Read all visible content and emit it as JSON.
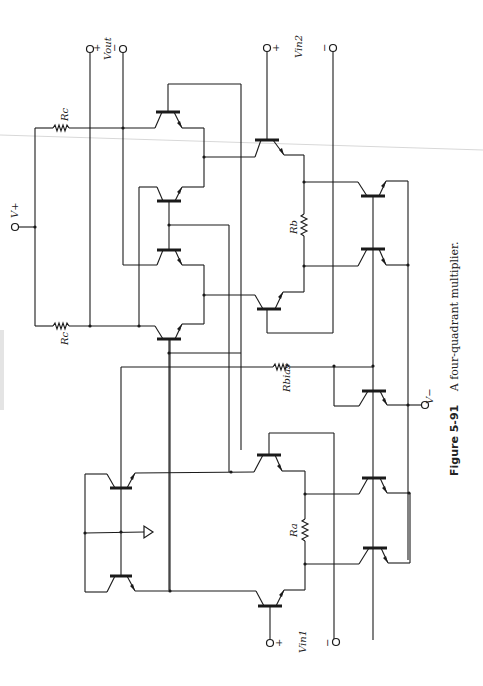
{
  "figure": {
    "number": "Figure 5-91",
    "caption": "A four-quadrant multiplier.",
    "orientation": "rotated 90° counter-clockwise (landscape page)"
  },
  "labels": {
    "v_plus": "V+",
    "v_minus": "V−",
    "v_out": "Vout",
    "v_in1": "Vin1",
    "v_in2": "Vin2",
    "rc_top": "Rc",
    "rc_bottom": "Rc",
    "rb": "Rb",
    "ra": "Ra",
    "rbias": "Rbias",
    "plus": "+",
    "minus": "−"
  },
  "components": {
    "resistors": [
      "Rc (top)",
      "Rc (bottom)",
      "Rb",
      "Ra",
      "Rbias"
    ],
    "transistor_count": 14,
    "terminals": [
      "V+",
      "V−",
      "Vout +",
      "Vout −",
      "Vin1 +",
      "Vin1 −",
      "Vin2 +",
      "Vin2 −"
    ],
    "ground_symbol": true
  },
  "colors": {
    "ink": "#1a1a1a",
    "paper": "#ffffff"
  }
}
